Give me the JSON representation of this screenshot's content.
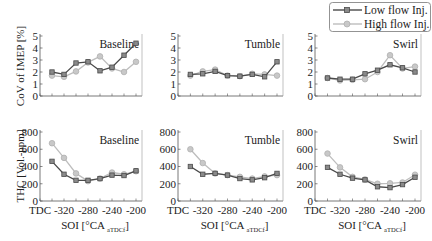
{
  "legend": {
    "low_label": "Low flow Inj.",
    "high_label": "High flow Inj."
  },
  "colors": {
    "low": "#4a4a4a",
    "low_marker_fill": "#8a8a8a",
    "high": "#bdbdbd",
    "high_marker_fill": "#c8c8c8",
    "axis": "#555555"
  },
  "axes": {
    "top_ylabel": "CoV of IMEP [%]",
    "bottom_ylabel": "THC [Vol.-ppm]",
    "xlabel_main": "SOI [°CA ",
    "xlabel_sub": "aTDCf",
    "xlabel_end": "]"
  },
  "chart_data": {
    "type": "line",
    "layout": "2x3 grid of subplots, shared legend top-right",
    "x": [
      -340,
      -320,
      -300,
      -280,
      -260,
      -240,
      -220,
      -200
    ],
    "xticks": [
      "TDC",
      "-320",
      "-280",
      "-240",
      "-200"
    ],
    "xlabel": "SOI [°CA aTDCf]",
    "panels": [
      {
        "row": 0,
        "title": "Baseline",
        "ylabel": "CoV of IMEP [%]",
        "ylim": [
          0,
          5
        ],
        "yticks": [
          "0",
          "1",
          "2",
          "3",
          "4",
          "5"
        ],
        "series": [
          {
            "name": "Low flow Inj.",
            "values": [
              2.0,
              1.8,
              2.75,
              2.85,
              2.1,
              2.4,
              3.4,
              4.4
            ]
          },
          {
            "name": "High flow Inj.",
            "values": [
              1.7,
              1.6,
              2.05,
              2.8,
              3.3,
              2.3,
              2.0,
              2.85
            ]
          }
        ]
      },
      {
        "row": 0,
        "title": "Tumble",
        "ylabel": "",
        "ylim": [
          0,
          5
        ],
        "yticks": [
          "0",
          "1",
          "2",
          "3",
          "4",
          "5"
        ],
        "series": [
          {
            "name": "Low flow Inj.",
            "values": [
              1.8,
              1.85,
              2.05,
              1.7,
              1.65,
              1.8,
              1.6,
              2.85
            ]
          },
          {
            "name": "High flow Inj.",
            "values": [
              1.7,
              2.05,
              2.2,
              1.7,
              1.65,
              1.85,
              1.8,
              1.7
            ]
          }
        ]
      },
      {
        "row": 0,
        "title": "Swirl",
        "ylabel": "",
        "ylim": [
          0,
          5
        ],
        "yticks": [
          "0",
          "1",
          "2",
          "3",
          "4",
          "5"
        ],
        "series": [
          {
            "name": "Low flow Inj.",
            "values": [
              1.5,
              1.4,
              1.4,
              1.85,
              2.15,
              2.6,
              2.35,
              2.0
            ]
          },
          {
            "name": "High flow Inj.",
            "values": [
              1.5,
              1.3,
              1.35,
              1.4,
              2.0,
              3.4,
              2.3,
              2.45
            ]
          }
        ]
      },
      {
        "row": 1,
        "title": "Baseline",
        "ylabel": "THC [Vol.-ppm]",
        "ylim": [
          0,
          800
        ],
        "yticks": [
          "0",
          "200",
          "400",
          "600",
          "800"
        ],
        "series": [
          {
            "name": "Low flow Inj.",
            "values": [
              460,
              310,
              240,
              240,
              260,
              300,
              295,
              350
            ]
          },
          {
            "name": "High flow Inj.",
            "values": [
              670,
              500,
              320,
              230,
              260,
              330,
              310,
              345
            ]
          }
        ]
      },
      {
        "row": 1,
        "title": "Tumble",
        "ylabel": "",
        "ylim": [
          0,
          800
        ],
        "yticks": [
          "0",
          "200",
          "400",
          "600",
          "800"
        ],
        "series": [
          {
            "name": "Low flow Inj.",
            "values": [
              400,
              310,
              320,
              300,
              260,
              245,
              270,
              320
            ]
          },
          {
            "name": "High flow Inj.",
            "values": [
              600,
              440,
              320,
              300,
              280,
              260,
              285,
              300
            ]
          }
        ]
      },
      {
        "row": 1,
        "title": "Swirl",
        "ylabel": "",
        "ylim": [
          0,
          800
        ],
        "yticks": [
          "0",
          "200",
          "400",
          "600",
          "800"
        ],
        "series": [
          {
            "name": "Low flow Inj.",
            "values": [
              390,
              310,
              265,
              245,
              165,
              155,
              190,
              275
            ]
          },
          {
            "name": "High flow Inj.",
            "values": [
              550,
              390,
              280,
              250,
              200,
              205,
              215,
              305
            ]
          }
        ]
      }
    ]
  }
}
